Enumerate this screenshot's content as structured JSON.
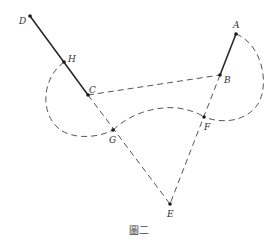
{
  "figure": {
    "caption": "圖二",
    "points": {
      "A": {
        "label": "A",
        "x": 236,
        "y": 34
      },
      "B": {
        "label": "B",
        "x": 220,
        "y": 75
      },
      "C": {
        "label": "C",
        "x": 88,
        "y": 95
      },
      "D": {
        "label": "D",
        "x": 30,
        "y": 16
      },
      "E": {
        "label": "E",
        "x": 170,
        "y": 204
      },
      "F": {
        "label": "F",
        "x": 204,
        "y": 117
      },
      "G": {
        "label": "G",
        "x": 113,
        "y": 130
      },
      "H": {
        "label": "H",
        "x": 64,
        "y": 62
      }
    },
    "segments": [
      {
        "from": "D",
        "to": "C",
        "style": "solid"
      },
      {
        "from": "A",
        "to": "B",
        "style": "solid"
      },
      {
        "from": "C",
        "to": "B",
        "style": "dashed"
      },
      {
        "from": "C",
        "to": "E",
        "style": "dashed"
      },
      {
        "from": "B",
        "to": "E",
        "style": "dashed"
      }
    ],
    "arcs": [
      {
        "name": "left-arc",
        "from": "H",
        "to": "G",
        "center": "C",
        "style": "dashed"
      },
      {
        "name": "right-arc",
        "from": "A",
        "to": "F",
        "center": "B",
        "style": "dashed"
      },
      {
        "name": "middle-curve",
        "from": "G",
        "to": "F",
        "style": "dashed"
      }
    ],
    "colors": {
      "line": "#2a2a2a",
      "dash": "#555555",
      "background": "#ffffff"
    }
  }
}
